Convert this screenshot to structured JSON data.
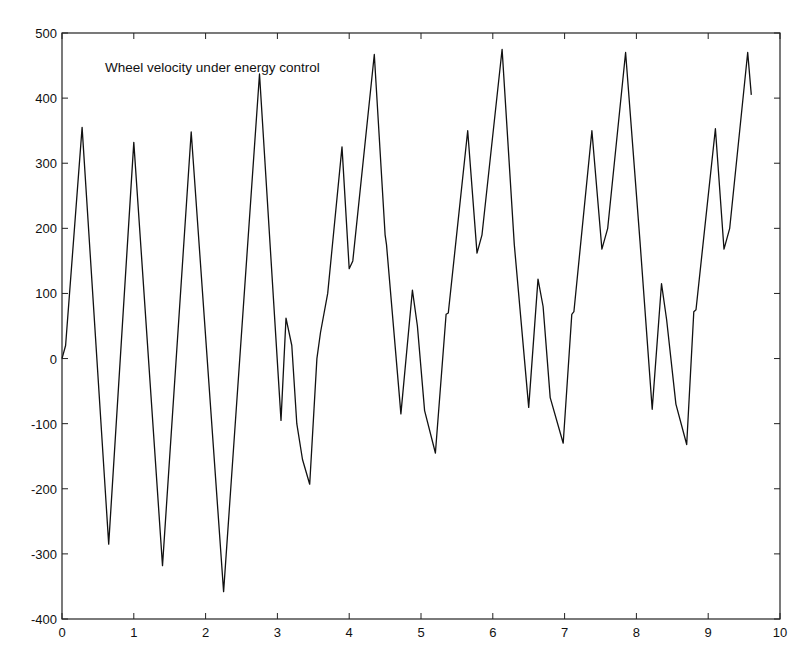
{
  "chart_data": {
    "type": "line",
    "title": "Wheel velocity under energy control",
    "xlabel": "",
    "ylabel": "",
    "xlim": [
      0,
      10
    ],
    "ylim": [
      -400,
      500
    ],
    "xticks": [
      0,
      1,
      2,
      3,
      4,
      5,
      6,
      7,
      8,
      9,
      10
    ],
    "yticks": [
      -400,
      -300,
      -200,
      -100,
      0,
      100,
      200,
      300,
      400,
      500
    ],
    "grid": false,
    "legend": null,
    "annotation": {
      "text": "Wheel velocity under energy control",
      "x": 0.6,
      "y": 440
    },
    "series": [
      {
        "name": "Wheel velocity",
        "color": "#111111",
        "x": [
          0,
          0.05,
          0.28,
          0.65,
          1.0,
          1.4,
          1.8,
          2.25,
          2.75,
          3.05,
          3.12,
          3.2,
          3.27,
          3.35,
          3.45,
          3.55,
          3.6,
          3.7,
          3.9,
          4.0,
          4.05,
          4.35,
          4.5,
          4.52,
          4.72,
          4.88,
          4.95,
          5.05,
          5.2,
          5.35,
          5.38,
          5.65,
          5.78,
          5.85,
          6.13,
          6.3,
          6.5,
          6.63,
          6.7,
          6.8,
          6.98,
          7.1,
          7.13,
          7.38,
          7.52,
          7.6,
          7.85,
          8.05,
          8.22,
          8.35,
          8.42,
          8.55,
          8.7,
          8.8,
          8.83,
          9.1,
          9.22,
          9.3,
          9.55,
          9.6
        ],
        "values": [
          0,
          20,
          355,
          -285,
          332,
          -318,
          348,
          -358,
          437,
          -95,
          62,
          20,
          -100,
          -155,
          -193,
          0,
          40,
          100,
          325,
          138,
          150,
          467,
          190,
          175,
          -85,
          105,
          50,
          -80,
          -145,
          68,
          70,
          350,
          162,
          190,
          475,
          175,
          -75,
          122,
          80,
          -60,
          -130,
          68,
          72,
          350,
          168,
          200,
          470,
          180,
          -78,
          115,
          60,
          -70,
          -132,
          72,
          75,
          353,
          168,
          200,
          470,
          405
        ]
      }
    ]
  }
}
